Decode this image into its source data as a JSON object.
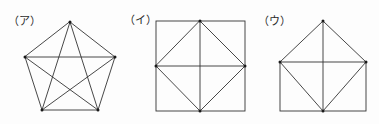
{
  "page": {
    "background_color": "#fdfdfd",
    "stroke_color": "#333333",
    "vertex_color": "#1a1a1a",
    "width": 379,
    "height": 124
  },
  "figures": [
    {
      "label": "（ア）",
      "label_plain": "(ア)",
      "shape_name": "pentagon-with-all-diagonals",
      "description": "Regular pentagon with all five diagonals drawn, forming an inscribed pentagram",
      "vertices": 5,
      "edges": 5,
      "diagonals": 5,
      "total_segments": 10,
      "points": [
        {
          "name": "apex",
          "x": 70,
          "y": 22
        },
        {
          "name": "upper-right",
          "x": 115,
          "y": 57
        },
        {
          "name": "lower-right",
          "x": 98,
          "y": 110
        },
        {
          "name": "lower-left",
          "x": 42,
          "y": 110
        },
        {
          "name": "upper-left",
          "x": 25,
          "y": 57
        }
      ],
      "outline": [
        [
          0,
          1
        ],
        [
          1,
          2
        ],
        [
          2,
          3
        ],
        [
          3,
          4
        ],
        [
          4,
          0
        ]
      ],
      "inner_lines": [
        [
          0,
          2
        ],
        [
          0,
          3
        ],
        [
          1,
          3
        ],
        [
          1,
          4
        ],
        [
          2,
          4
        ]
      ]
    },
    {
      "label": "（イ）",
      "label_plain": "(イ)",
      "shape_name": "square-with-inscribed-diamond",
      "description": "Square with an inscribed diamond joining the four edge midpoints, plus horizontal and vertical centre lines",
      "vertices": 4,
      "edges": 4,
      "total_segments": 10,
      "points": [
        {
          "name": "top-left",
          "x": 156,
          "y": 21
        },
        {
          "name": "top-right",
          "x": 245,
          "y": 21
        },
        {
          "name": "bottom-right",
          "x": 245,
          "y": 111
        },
        {
          "name": "bottom-left",
          "x": 156,
          "y": 111
        },
        {
          "name": "mid-top",
          "x": 200,
          "y": 21
        },
        {
          "name": "mid-right",
          "x": 245,
          "y": 66
        },
        {
          "name": "mid-bottom",
          "x": 200,
          "y": 111
        },
        {
          "name": "mid-left",
          "x": 156,
          "y": 66
        }
      ],
      "outline": [
        [
          0,
          1
        ],
        [
          1,
          2
        ],
        [
          2,
          3
        ],
        [
          3,
          0
        ]
      ],
      "inner_lines": [
        [
          4,
          5
        ],
        [
          5,
          6
        ],
        [
          6,
          7
        ],
        [
          7,
          4
        ],
        [
          4,
          6
        ],
        [
          7,
          5
        ]
      ]
    },
    {
      "label": "（ウ）",
      "label_plain": "(ウ)",
      "shape_name": "house-rectangle-with-roof",
      "description": "Rectangle topped by a triangular roof; diamond diagonals plus horizontal and vertical centre lines",
      "vertices": 5,
      "total_segments": 10,
      "points": [
        {
          "name": "apex",
          "x": 323,
          "y": 21
        },
        {
          "name": "rect-top-left",
          "x": 280,
          "y": 62
        },
        {
          "name": "rect-top-right",
          "x": 366,
          "y": 62
        },
        {
          "name": "rect-bottom-right",
          "x": 366,
          "y": 111
        },
        {
          "name": "rect-bottom-left",
          "x": 280,
          "y": 111
        },
        {
          "name": "mid-bottom",
          "x": 323,
          "y": 111
        }
      ],
      "outline": [
        [
          1,
          2
        ],
        [
          2,
          3
        ],
        [
          3,
          4
        ],
        [
          4,
          1
        ],
        [
          1,
          0
        ],
        [
          0,
          2
        ]
      ],
      "inner_lines": [
        [
          1,
          5
        ],
        [
          5,
          2
        ],
        [
          0,
          5
        ],
        [
          1,
          2
        ]
      ]
    }
  ]
}
